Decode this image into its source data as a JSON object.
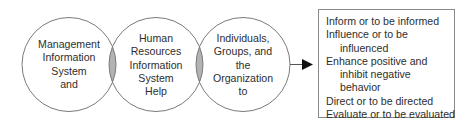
{
  "diagram": {
    "circles": [
      {
        "lines": [
          "Management",
          "Information",
          "System",
          "and"
        ]
      },
      {
        "lines": [
          "Human",
          "Resources",
          "Information",
          "System",
          "Help"
        ]
      },
      {
        "lines": [
          "Individuals,",
          "Groups, and",
          "the",
          "Organization",
          "to"
        ]
      }
    ],
    "outcomes_box": {
      "lines": [
        {
          "text": "Inform or to be informed",
          "indent": false
        },
        {
          "text": "Influence or to be",
          "indent": false
        },
        {
          "text": "influenced",
          "indent": true
        },
        {
          "text": "Enhance positive and",
          "indent": false
        },
        {
          "text": "inhibit negative",
          "indent": true
        },
        {
          "text": "behavior",
          "indent": true
        },
        {
          "text": "Direct or to be directed",
          "indent": false
        },
        {
          "text": "Evaluate or to be evaluated",
          "indent": false
        }
      ]
    },
    "colors": {
      "stroke": "#7a7a7a",
      "overlap_fill": "#b3b3b3",
      "arrow": "#111111",
      "box_border": "#8a8a8a"
    }
  }
}
